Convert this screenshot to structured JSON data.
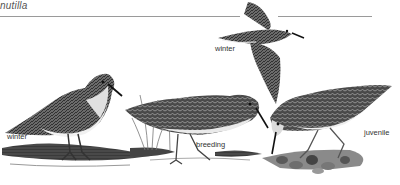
{
  "plate": {
    "title": "nutilla",
    "subject": "Least Sandpiper plumages",
    "labels": {
      "flying": "winter",
      "standing_left": "winter",
      "center": "breeding",
      "right": "juvenile"
    }
  }
}
